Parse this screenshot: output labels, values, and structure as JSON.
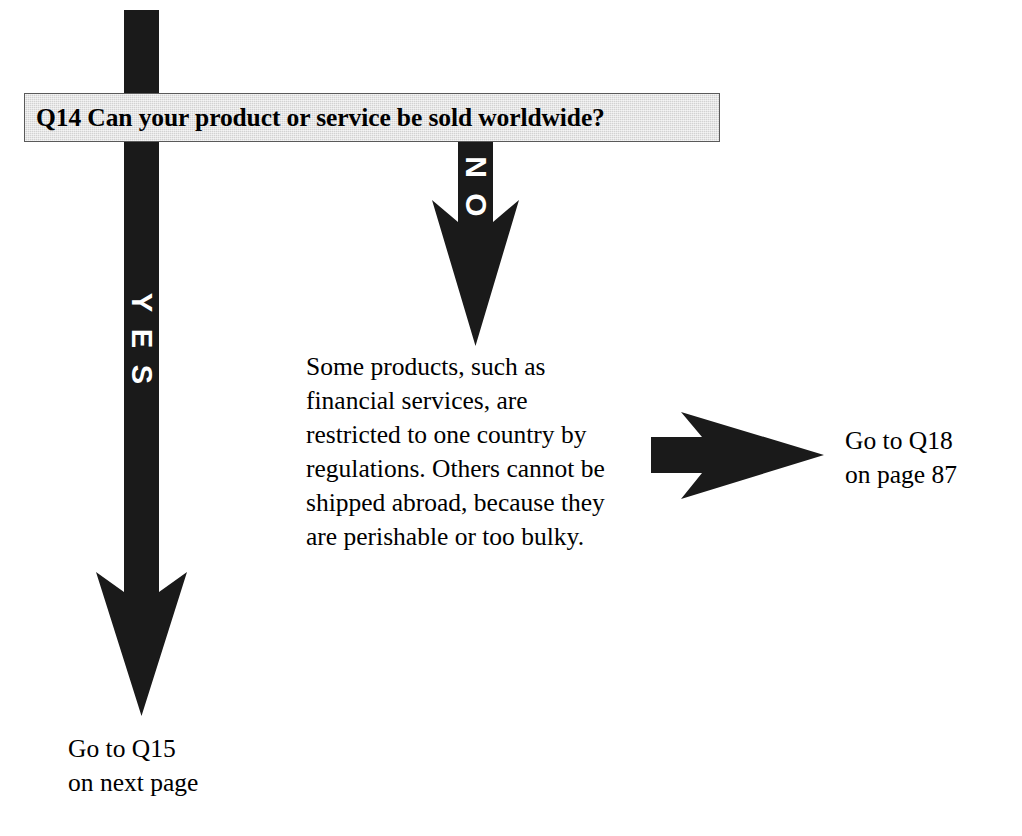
{
  "diagram": {
    "type": "decision-flowchart",
    "title": "Q14 Can your product or service be sold worldwide?",
    "background_color": "#ffffff",
    "ink_color": "#1a1a1a",
    "banner_fill": "#d2d2d2",
    "banner_border": "#5a5a5a"
  },
  "question": {
    "id": "Q14",
    "text": "Q14 Can your product or service be sold worldwide?"
  },
  "branches": {
    "yes": {
      "label": "YES",
      "label_color": "#ffffff",
      "direction": "down",
      "outcome_line_1": "Go to Q15",
      "outcome_line_2": "on next page"
    },
    "no": {
      "label": "NO",
      "label_color": "#ffffff",
      "direction": "down",
      "note_lines": [
        "Some products, such as",
        "financial services, are",
        "restricted to one country by",
        "regulations. Others cannot be",
        "shipped abroad, because they",
        "are perishable or too bulky."
      ],
      "note_text": "Some products, such as financial services, are restricted to one country by regulations. Others cannot be shipped abroad, because they are perishable or too bulky.",
      "outcome_line_1": "Go to Q18",
      "outcome_line_2": "on page 87"
    }
  },
  "outcomes": [
    {
      "id": "q15",
      "line_1": "Go to Q15",
      "line_2": "on next page"
    },
    {
      "id": "q18",
      "line_1": "Go to Q18",
      "line_2": "on page 87"
    }
  ]
}
